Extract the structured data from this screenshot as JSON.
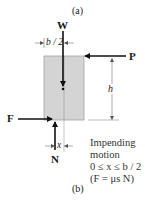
{
  "figure": {
    "label_a": "(a)",
    "label_b": "(b)",
    "forces": {
      "W": "W",
      "P": "P",
      "F": "F",
      "N": "N"
    },
    "dimensions": {
      "half_width": "b / 2",
      "height": "h",
      "offset": "x"
    },
    "note": {
      "line1": "Impending",
      "line2": "motion",
      "line3": "0 ≤ x ≤ b / 2",
      "line4": "(F = μs N)"
    },
    "colors": {
      "block_fill": "#d4d4d4",
      "block_stroke": "#9a9a9a",
      "arrow": "#111111",
      "dim_line": "#555555"
    }
  }
}
